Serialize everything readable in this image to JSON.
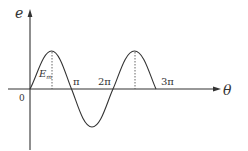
{
  "diagram": {
    "type": "waveform",
    "axes": {
      "y_label": "e",
      "x_label": "θ",
      "origin_label": "0"
    },
    "tick_labels": [
      "π",
      "2π",
      "3π"
    ],
    "amplitude_label": {
      "main": "E",
      "subscript": "m"
    },
    "colors": {
      "line": "#333333",
      "background": "#ffffff"
    }
  }
}
